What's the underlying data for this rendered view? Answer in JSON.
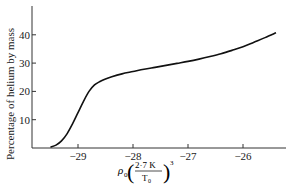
{
  "chart_data": {
    "type": "line",
    "title": "",
    "xlabel": "ρ0 (2·7 K / T0)^3",
    "xlabel_parts": {
      "rho": "ρ",
      "sub0": "0",
      "num": "2·7 K",
      "den": "T",
      "den_sub": "0",
      "exp": "3"
    },
    "ylabel": "Percentage of helium by mass",
    "xlim": [
      -29.6,
      -25.3
    ],
    "ylim": [
      0,
      50
    ],
    "x_ticks": [
      -29,
      -28,
      -27,
      -26
    ],
    "x_tick_labels": [
      "−29",
      "−28",
      "−27",
      "−26"
    ],
    "y_ticks": [
      10,
      20,
      30,
      40
    ],
    "y_tick_labels": [
      "10",
      "20",
      "30",
      "40"
    ],
    "grid": false,
    "legend": null,
    "series": [
      {
        "name": "helium abundance",
        "x": [
          -29.5,
          -29.4,
          -29.3,
          -29.2,
          -29.1,
          -29.0,
          -28.9,
          -28.8,
          -28.7,
          -28.6,
          -28.5,
          -28.4,
          -28.2,
          -28.0,
          -27.8,
          -27.6,
          -27.4,
          -27.2,
          -27.0,
          -26.8,
          -26.6,
          -26.4,
          -26.2,
          -26.0,
          -25.8,
          -25.6,
          -25.4
        ],
        "values": [
          0.3,
          1.0,
          2.5,
          5.0,
          8.5,
          12.5,
          16.5,
          20.0,
          22.3,
          23.5,
          24.4,
          25.1,
          26.2,
          27.0,
          27.8,
          28.5,
          29.2,
          29.9,
          30.6,
          31.4,
          32.3,
          33.3,
          34.5,
          35.8,
          37.4,
          39.0,
          40.7
        ]
      }
    ]
  }
}
